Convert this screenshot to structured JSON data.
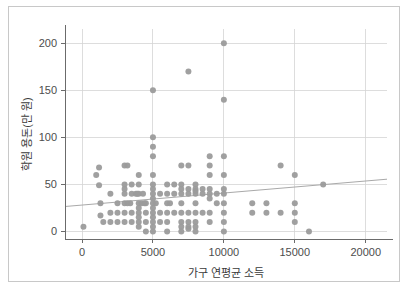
{
  "chart_data": {
    "type": "scatter",
    "title": "",
    "xlabel": "가구 연평균 소득",
    "ylabel": "학원 용돈(만 원)",
    "xlim": [
      -1200,
      21500
    ],
    "ylim": [
      -8,
      215
    ],
    "xticks": [
      0,
      5000,
      10000,
      15000,
      20000
    ],
    "xtick_labels": [
      "0",
      "5000",
      "10000",
      "15000",
      "20000"
    ],
    "yticks": [
      0,
      50,
      100,
      150,
      200
    ],
    "ytick_labels": [
      "0",
      "50",
      "100",
      "150",
      "200"
    ],
    "grid": true,
    "grid_color": "#d4d4d4",
    "legend": false,
    "point_color": "#9b9b9b",
    "point_size": 3.0,
    "trendline": {
      "visible": true,
      "color": "#a9a9a9",
      "x_start": -1200,
      "y_start": 26.5,
      "x_end": 21500,
      "y_end": 55.5
    },
    "points": [
      [
        100,
        5
      ],
      [
        1000,
        60
      ],
      [
        1200,
        68
      ],
      [
        1200,
        49
      ],
      [
        1300,
        30
      ],
      [
        1300,
        17
      ],
      [
        1500,
        10
      ],
      [
        2000,
        10
      ],
      [
        2000,
        40
      ],
      [
        2000,
        20
      ],
      [
        2500,
        30
      ],
      [
        2500,
        10
      ],
      [
        2500,
        20
      ],
      [
        3000,
        70
      ],
      [
        3200,
        70
      ],
      [
        3000,
        50
      ],
      [
        3000,
        45
      ],
      [
        3000,
        40
      ],
      [
        3000,
        30
      ],
      [
        3000,
        20
      ],
      [
        3000,
        10
      ],
      [
        3200,
        30
      ],
      [
        3400,
        30
      ],
      [
        3500,
        40
      ],
      [
        3500,
        50
      ],
      [
        3500,
        20
      ],
      [
        3500,
        10
      ],
      [
        3800,
        40
      ],
      [
        3900,
        40
      ],
      [
        4000,
        60
      ],
      [
        4000,
        50
      ],
      [
        4000,
        40
      ],
      [
        4000,
        30
      ],
      [
        4000,
        25
      ],
      [
        4000,
        20
      ],
      [
        4000,
        15
      ],
      [
        4000,
        10
      ],
      [
        4000,
        5
      ],
      [
        4200,
        30
      ],
      [
        4300,
        40
      ],
      [
        4400,
        30
      ],
      [
        4500,
        30
      ],
      [
        4500,
        20
      ],
      [
        4500,
        10
      ],
      [
        4500,
        0
      ],
      [
        5000,
        150
      ],
      [
        5000,
        100
      ],
      [
        5000,
        90
      ],
      [
        5000,
        80
      ],
      [
        5000,
        60
      ],
      [
        5000,
        50
      ],
      [
        5000,
        45
      ],
      [
        5000,
        40
      ],
      [
        5000,
        35
      ],
      [
        5000,
        30
      ],
      [
        5000,
        25
      ],
      [
        5000,
        20
      ],
      [
        5000,
        15
      ],
      [
        5000,
        10
      ],
      [
        5000,
        5
      ],
      [
        5000,
        0
      ],
      [
        5200,
        30
      ],
      [
        5500,
        40
      ],
      [
        5500,
        20
      ],
      [
        5500,
        10
      ],
      [
        6000,
        50
      ],
      [
        6000,
        40
      ],
      [
        6000,
        30
      ],
      [
        6000,
        20
      ],
      [
        6000,
        10
      ],
      [
        6000,
        0
      ],
      [
        6200,
        30
      ],
      [
        6500,
        50
      ],
      [
        6500,
        40
      ],
      [
        6500,
        20
      ],
      [
        7000,
        70
      ],
      [
        7000,
        50
      ],
      [
        7000,
        45
      ],
      [
        7000,
        40
      ],
      [
        7000,
        30
      ],
      [
        7000,
        20
      ],
      [
        7000,
        10
      ],
      [
        7000,
        5
      ],
      [
        7000,
        0
      ],
      [
        7500,
        170
      ],
      [
        7500,
        70
      ],
      [
        7500,
        45
      ],
      [
        7500,
        40
      ],
      [
        7500,
        20
      ],
      [
        7500,
        10
      ],
      [
        7500,
        5
      ],
      [
        7500,
        3
      ],
      [
        8000,
        50
      ],
      [
        8000,
        45
      ],
      [
        8000,
        43
      ],
      [
        8000,
        40
      ],
      [
        8000,
        30
      ],
      [
        8000,
        20
      ],
      [
        8000,
        10
      ],
      [
        8000,
        5
      ],
      [
        8000,
        0
      ],
      [
        8500,
        45
      ],
      [
        8500,
        40
      ],
      [
        8500,
        20
      ],
      [
        9000,
        80
      ],
      [
        9000,
        70
      ],
      [
        9000,
        60
      ],
      [
        9000,
        45
      ],
      [
        9000,
        40
      ],
      [
        9000,
        35
      ],
      [
        9000,
        20
      ],
      [
        9000,
        10
      ],
      [
        9500,
        40
      ],
      [
        9500,
        30
      ],
      [
        10000,
        200
      ],
      [
        10000,
        140
      ],
      [
        10000,
        80
      ],
      [
        10000,
        60
      ],
      [
        10000,
        45
      ],
      [
        10000,
        40
      ],
      [
        10000,
        30
      ],
      [
        10000,
        20
      ],
      [
        10000,
        10
      ],
      [
        10000,
        0
      ],
      [
        12000,
        30
      ],
      [
        12000,
        20
      ],
      [
        13000,
        30
      ],
      [
        13000,
        20
      ],
      [
        14000,
        70
      ],
      [
        14000,
        20
      ],
      [
        15000,
        60
      ],
      [
        15000,
        30
      ],
      [
        15000,
        20
      ],
      [
        15000,
        10
      ],
      [
        16000,
        0
      ],
      [
        17000,
        50
      ]
    ]
  }
}
